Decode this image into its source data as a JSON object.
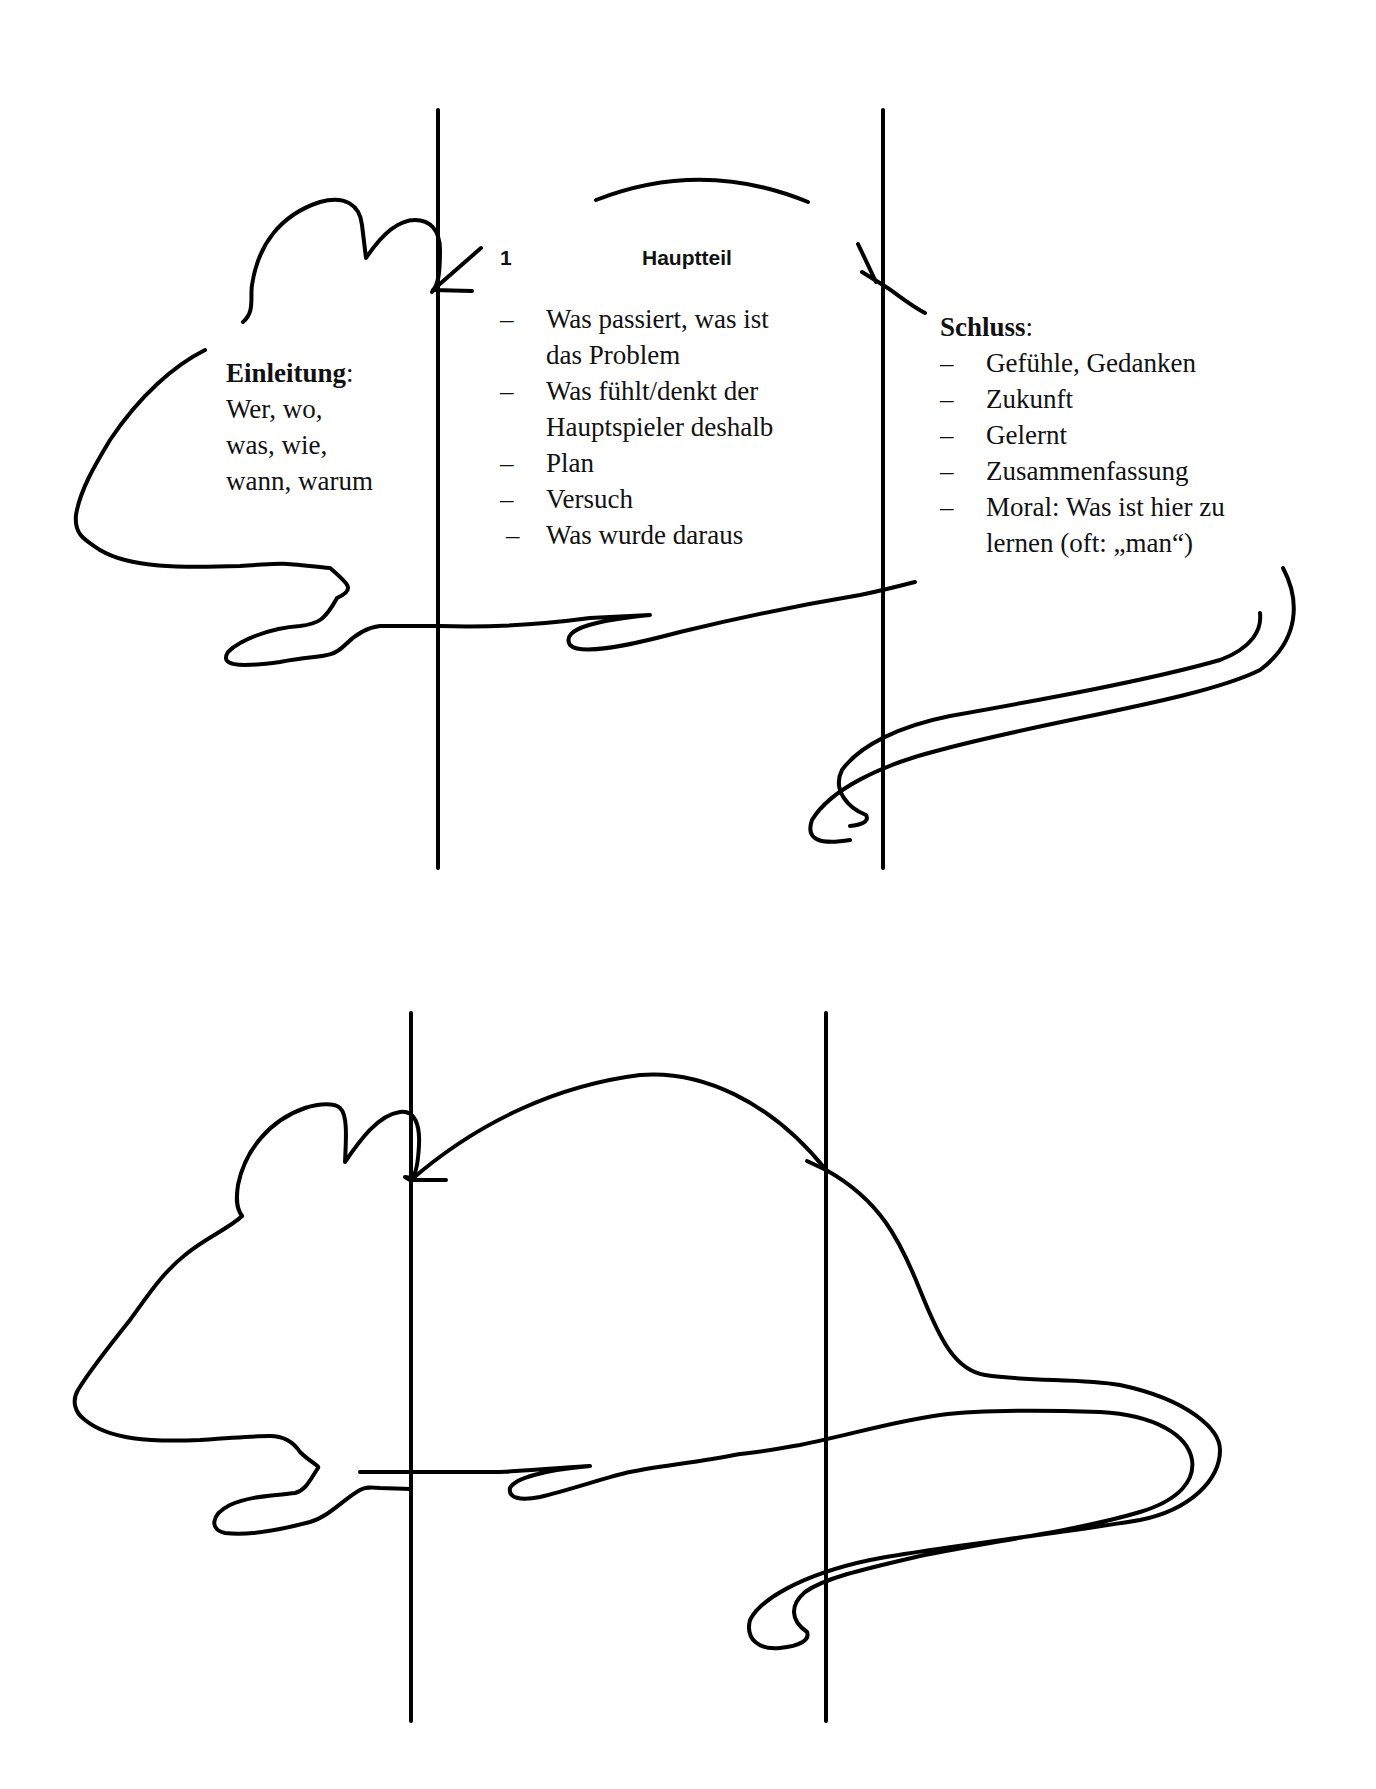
{
  "diagram": {
    "stroke_color": "#000000",
    "background": "#ffffff"
  },
  "top_mouse": {
    "einleitung": {
      "heading": "Einleitung",
      "colon": ":",
      "lines": [
        "Wer, wo,",
        "was, wie,",
        "wann, warum"
      ]
    },
    "hauptteil": {
      "number": "1",
      "heading": "Hauptteil",
      "items": [
        {
          "dash": "–",
          "lines": [
            "Was passiert, was ist",
            "das Problem"
          ]
        },
        {
          "dash": "–",
          "lines": [
            "Was fühlt/denkt der",
            "Hauptspieler deshalb"
          ]
        },
        {
          "dash": "–",
          "lines": [
            "Plan"
          ]
        },
        {
          "dash": "–",
          "lines": [
            "Versuch"
          ]
        },
        {
          "dash": "–",
          "lines": [
            "Was wurde daraus"
          ]
        }
      ]
    },
    "schluss": {
      "heading": "Schluss",
      "colon": ":",
      "items": [
        {
          "dash": "–",
          "lines": [
            "Gefühle, Gedanken"
          ]
        },
        {
          "dash": "–",
          "lines": [
            "Zukunft"
          ]
        },
        {
          "dash": "–",
          "lines": [
            "Gelernt"
          ]
        },
        {
          "dash": "–",
          "lines": [
            "Zusammenfassung"
          ]
        },
        {
          "dash": "–",
          "lines": [
            "Moral: Was ist hier zu",
            "lernen (oft: „man“)"
          ]
        }
      ]
    }
  },
  "bottom_mouse": {
    "label": "blank template (no text)"
  }
}
